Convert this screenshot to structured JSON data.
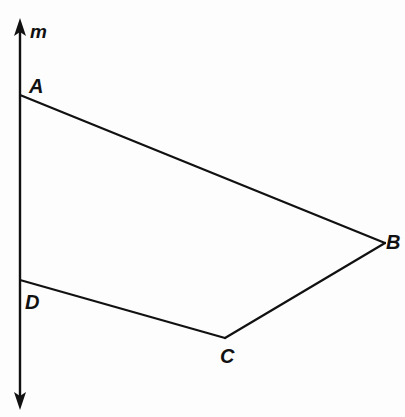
{
  "figure": {
    "kind": "geometry-diagram",
    "width": 405,
    "height": 417,
    "background_color": "#fdfdfd",
    "stroke_color": "#111111",
    "stroke_width": 2
  },
  "line_m": {
    "name": "m",
    "label": "m",
    "orientation": "vertical",
    "x": 20,
    "y_top_tip": 18,
    "y_bottom_tip": 410,
    "arrowheads": "both",
    "arrowhead_name": "double-arrow-line"
  },
  "points": [
    {
      "id": "A",
      "label": "A",
      "x": 20,
      "y": 95,
      "on_line_m": true
    },
    {
      "id": "B",
      "label": "B",
      "x": 385,
      "y": 243,
      "on_line_m": false
    },
    {
      "id": "C",
      "label": "C",
      "x": 225,
      "y": 338,
      "on_line_m": false
    },
    {
      "id": "D",
      "label": "D",
      "x": 20,
      "y": 280,
      "on_line_m": true
    }
  ],
  "segments": [
    {
      "id": "AB",
      "from": "A",
      "to": "B",
      "x1": 20,
      "y1": 95,
      "x2": 385,
      "y2": 243
    },
    {
      "id": "BC",
      "from": "B",
      "to": "C",
      "x1": 385,
      "y1": 243,
      "x2": 225,
      "y2": 338
    },
    {
      "id": "CD",
      "from": "C",
      "to": "D",
      "x1": 225,
      "y1": 338,
      "x2": 20,
      "y2": 280
    }
  ],
  "labels": {
    "m": "m",
    "A": "A",
    "B": "B",
    "C": "C",
    "D": "D"
  }
}
